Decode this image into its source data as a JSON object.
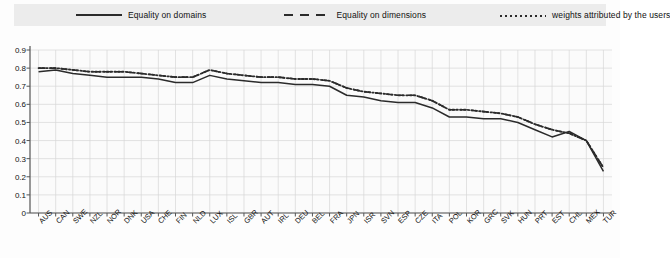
{
  "legend": {
    "items": [
      {
        "label": "Equality on domains",
        "style": "solid",
        "icon": "line-solid-icon"
      },
      {
        "label": "Equality on dimensions",
        "style": "dashed",
        "icon": "line-dashed-icon"
      },
      {
        "label": "weights attributed by the users",
        "style": "dotted",
        "icon": "line-dotted-icon"
      }
    ]
  },
  "chart_data": {
    "type": "line",
    "title": "",
    "xlabel": "",
    "ylabel": "",
    "ylim": [
      0,
      0.9
    ],
    "ytick_labels": [
      "0.9",
      "0.8",
      "0.7",
      "0.6",
      "0.5",
      "0.4",
      "0.3",
      "0.2",
      "0.1",
      "0"
    ],
    "yticks": [
      0.9,
      0.8,
      0.7,
      0.6,
      0.5,
      0.4,
      0.3,
      0.2,
      0.1,
      0
    ],
    "grid": true,
    "legend_position": "top",
    "categories": [
      "AUS",
      "CAN",
      "SWE",
      "NZL",
      "NOR",
      "DNK",
      "USA",
      "CHE",
      "FIN",
      "NLD",
      "LUX",
      "ISL",
      "GBR",
      "AUT",
      "IRL",
      "DEU",
      "BEL",
      "FRA",
      "JPN",
      "ISR",
      "SVN",
      "ESP",
      "CZE",
      "ITA",
      "POL",
      "KOR",
      "GRC",
      "SVK",
      "HUN",
      "PRT",
      "EST",
      "CHL",
      "MEX",
      "TUR"
    ],
    "series": [
      {
        "name": "Equality on domains",
        "style": "solid",
        "values": [
          0.78,
          0.79,
          0.77,
          0.76,
          0.75,
          0.75,
          0.75,
          0.74,
          0.72,
          0.72,
          0.76,
          0.74,
          0.73,
          0.72,
          0.72,
          0.71,
          0.71,
          0.7,
          0.65,
          0.64,
          0.62,
          0.61,
          0.61,
          0.58,
          0.53,
          0.53,
          0.52,
          0.52,
          0.5,
          0.46,
          0.42,
          0.45,
          0.4,
          0.23
        ]
      },
      {
        "name": "Equality on dimensions",
        "style": "dashed",
        "values": [
          0.8,
          0.8,
          0.79,
          0.78,
          0.78,
          0.78,
          0.77,
          0.76,
          0.75,
          0.75,
          0.79,
          0.77,
          0.76,
          0.75,
          0.75,
          0.74,
          0.74,
          0.73,
          0.69,
          0.67,
          0.66,
          0.65,
          0.65,
          0.62,
          0.57,
          0.57,
          0.56,
          0.55,
          0.53,
          0.49,
          0.46,
          0.44,
          0.4,
          0.25
        ]
      },
      {
        "name": "weights attributed by the users",
        "style": "dotted",
        "values": [
          0.8,
          0.8,
          0.79,
          0.78,
          0.78,
          0.78,
          0.77,
          0.76,
          0.75,
          0.75,
          0.79,
          0.77,
          0.76,
          0.75,
          0.75,
          0.74,
          0.74,
          0.73,
          0.69,
          0.67,
          0.66,
          0.65,
          0.65,
          0.62,
          0.57,
          0.57,
          0.56,
          0.55,
          0.53,
          0.49,
          0.46,
          0.44,
          0.4,
          0.25
        ]
      }
    ]
  },
  "colors": {
    "line": "#2b2b2b",
    "grid": "#d7d7d7",
    "axis": "#555555",
    "legend_bg": "#ececec",
    "background": "#fdfdfd"
  }
}
